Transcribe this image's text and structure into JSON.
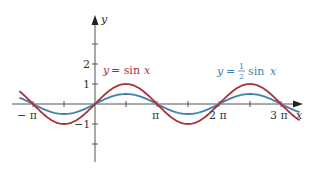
{
  "chart_data": {
    "type": "line",
    "title": "",
    "xlabel": "x",
    "ylabel": "y",
    "x_ticks": [
      "−π",
      "π",
      "2π",
      "3π"
    ],
    "y_ticks": [
      "2",
      "1",
      "−1"
    ],
    "xlim": [
      -1.2,
      3.3
    ],
    "xlim_units": "multiples of π",
    "ylim": [
      -3,
      3
    ],
    "grid": false,
    "series": [
      {
        "name": "y = sin x",
        "function": "sin(x)",
        "amplitude": 1,
        "color": "#a8323a"
      },
      {
        "name": "y = 1/2 sin x",
        "function": "0.5*sin(x)",
        "amplitude": 0.5,
        "color": "#3f83a8"
      }
    ],
    "annotations": [
      {
        "text": "y = sin x",
        "color": "#a8323a"
      },
      {
        "text": "y = ½ sin x",
        "color": "#3f83a8"
      }
    ]
  },
  "labels": {
    "x_axis": "x",
    "y_axis": "y",
    "tick_neg_pi": "− π",
    "tick_pi": "π",
    "tick_2pi": "2 π",
    "tick_3pi": "3 π",
    "tick_y2": "2",
    "tick_y1": "1",
    "tick_ym1": "−1",
    "red_label_y": "y",
    "red_label_eq": "= sin",
    "red_label_x": "x",
    "blue_label_y": "y",
    "blue_label_eq": "=",
    "blue_label_num": "1",
    "blue_label_den": "2",
    "blue_label_sin": "sin",
    "blue_label_x": "x"
  },
  "colors": {
    "red": "#a8323a",
    "blue": "#3f83a8",
    "axis": "#555555"
  }
}
